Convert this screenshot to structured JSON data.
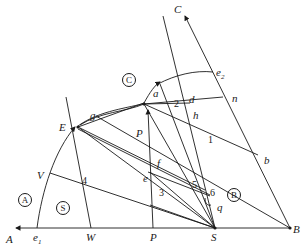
{
  "diagram": {
    "type": "geometric construction (pole / polar diagram)",
    "point_labels": {
      "A": "A",
      "B": "B",
      "C": "C",
      "E": "E",
      "P_upper": "P",
      "P_lower": "P",
      "S": "S",
      "W": "W",
      "V": "V",
      "e1": "e",
      "e1_sub": "1",
      "e2": "e",
      "e2_sub": "2",
      "a": "a",
      "b": "b",
      "d": "d",
      "e": "e",
      "f": "f",
      "g": "g",
      "h": "h",
      "n": "n",
      "q": "q"
    },
    "numbered_points": [
      "1",
      "2",
      "3",
      "4",
      "5",
      "6"
    ],
    "region_labels": {
      "A": "A",
      "B": "B",
      "C": "C",
      "S": "S"
    },
    "colors": {
      "line": "#1a1a1a",
      "background": "#ffffff"
    }
  }
}
